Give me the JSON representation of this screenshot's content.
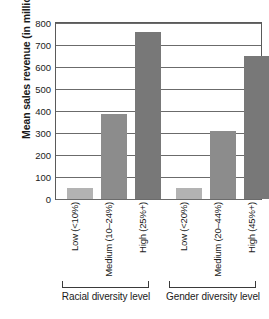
{
  "chart_data": {
    "type": "bar",
    "title": "",
    "xlabel": "",
    "ylabel": "Mean sales revenue (in millions)",
    "ylim": [
      0,
      800
    ],
    "yticks": [
      0,
      100,
      200,
      300,
      400,
      500,
      600,
      700,
      800
    ],
    "ytick_labels": [
      "0",
      "100",
      "200",
      "300",
      "400",
      "500",
      "600",
      "700",
      "800"
    ],
    "grid": true,
    "legend": "none",
    "categories": [
      "Low (<10%)",
      "Medium (10–24%)",
      "High (25%+)",
      "Low (<20%)",
      "Medium (20–44%)",
      "High (45%+)"
    ],
    "values": [
      51,
      385,
      761,
      48,
      307,
      648
    ],
    "groups": [
      {
        "label": "Racial diversity level",
        "categories": [
          "Low (<10%)",
          "Medium (10–24%)",
          "High (25%+)"
        ],
        "values": [
          51,
          385,
          761
        ]
      },
      {
        "label": "Gender diversity level",
        "categories": [
          "Low (<20%)",
          "Medium (20–44%)",
          "High (45%+)"
        ],
        "values": [
          48,
          307,
          648
        ]
      }
    ],
    "bar_colors": [
      "#b3b3b3",
      "#8c8c8c",
      "#787878",
      "#b3b3b3",
      "#8c8c8c",
      "#787878"
    ]
  },
  "axis": {
    "y_title": "Mean sales revenue (in millions)",
    "ticks": [
      "800",
      "700",
      "600",
      "500",
      "400",
      "300",
      "200",
      "100",
      "0"
    ]
  },
  "x_tick_labels": [
    "Low (<10%)",
    "Medium (10–24%)",
    "High (25%+)",
    "Low (<20%)",
    "Medium (20–44%)",
    "High (45%+)"
  ],
  "group_labels": {
    "racial": "Racial diversity level",
    "gender": "Gender diversity level"
  }
}
